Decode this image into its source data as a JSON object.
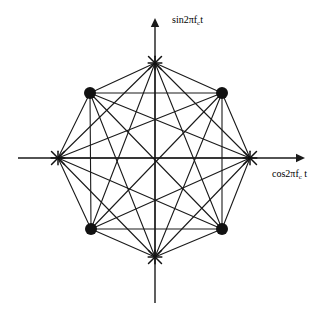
{
  "figure": {
    "background_color": "#ffffff",
    "stroke_color": "#1a1a1a",
    "width": 325,
    "height": 324
  },
  "axes": {
    "origin": {
      "x": 155,
      "y": 158
    },
    "x_axis": {
      "label_text": "cos2πf",
      "label_sub": "c",
      "label_tail": " t",
      "label_full": "cos2πf_c t",
      "start_x": 18,
      "end_x": 305,
      "y": 158,
      "arrow": "right"
    },
    "y_axis": {
      "label_text": "sin2πf",
      "label_sub": "c",
      "label_tail": "t",
      "label_full": "sin2πf_c t",
      "start_y": 303,
      "end_y": 18,
      "x": 155,
      "arrow": "up"
    }
  },
  "chart_data": {
    "type": "scatter",
    "xlabel": "cos2πf_c t",
    "ylabel": "sin2πf_c t",
    "xlim": [
      -1.45,
      1.55
    ],
    "ylim": [
      -1.45,
      1.4
    ],
    "grid": false,
    "legend": "none",
    "radius_px": 95,
    "points": [
      {
        "id": "p0",
        "angle_deg": 0,
        "x": 1.0,
        "y": 0.0,
        "px": 250,
        "py": 158,
        "marker": "cross",
        "label": ""
      },
      {
        "id": "p1",
        "angle_deg": 45,
        "x": 0.707,
        "y": 0.707,
        "px": 222,
        "py": 93,
        "marker": "circle",
        "label": ""
      },
      {
        "id": "p2",
        "angle_deg": 90,
        "x": 0.0,
        "y": 1.0,
        "px": 155,
        "py": 63,
        "marker": "cross",
        "label": ""
      },
      {
        "id": "p3",
        "angle_deg": 135,
        "x": -0.707,
        "y": 0.707,
        "px": 90,
        "py": 93,
        "marker": "circle",
        "label": ""
      },
      {
        "id": "p4",
        "angle_deg": 180,
        "x": -1.0,
        "y": 0.0,
        "px": 58,
        "py": 158,
        "marker": "cross",
        "label": ""
      },
      {
        "id": "p5",
        "angle_deg": 225,
        "x": -0.707,
        "y": -0.707,
        "px": 91,
        "py": 229,
        "marker": "circle",
        "label": ""
      },
      {
        "id": "p6",
        "angle_deg": 270,
        "x": 0.0,
        "y": -1.0,
        "px": 155,
        "py": 257,
        "marker": "cross",
        "label": ""
      },
      {
        "id": "p7",
        "angle_deg": 315,
        "x": 0.707,
        "y": -0.707,
        "px": 222,
        "py": 229,
        "marker": "circle",
        "label": ""
      }
    ],
    "edges": [
      [
        0,
        1
      ],
      [
        0,
        2
      ],
      [
        0,
        3
      ],
      [
        0,
        4
      ],
      [
        0,
        5
      ],
      [
        0,
        6
      ],
      [
        0,
        7
      ],
      [
        1,
        2
      ],
      [
        1,
        3
      ],
      [
        1,
        4
      ],
      [
        1,
        5
      ],
      [
        1,
        6
      ],
      [
        1,
        7
      ],
      [
        2,
        3
      ],
      [
        2,
        4
      ],
      [
        2,
        5
      ],
      [
        2,
        6
      ],
      [
        2,
        7
      ],
      [
        3,
        4
      ],
      [
        3,
        5
      ],
      [
        3,
        6
      ],
      [
        3,
        7
      ],
      [
        4,
        5
      ],
      [
        4,
        6
      ],
      [
        4,
        7
      ],
      [
        5,
        6
      ],
      [
        5,
        7
      ],
      [
        6,
        7
      ]
    ],
    "marker_styles": {
      "circle": {
        "shape": "filled-circle",
        "radius_px": 6,
        "color": "#111111"
      },
      "cross": {
        "shape": "asterisk-cross",
        "radius_px": 9,
        "color": "#111111"
      }
    }
  }
}
